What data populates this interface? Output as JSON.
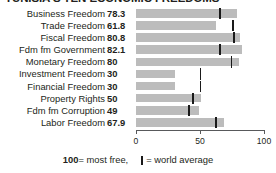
{
  "title": "TUNISIA'S TEN ECONOMIC FREEDOMS",
  "chart_data": {
    "type": "bar",
    "orientation": "horizontal",
    "title": "TUNISIA'S TEN ECONOMIC FREEDOMS",
    "xlabel": "",
    "ylabel": "",
    "xlim": [
      0,
      100
    ],
    "ticks": [
      "0",
      "50",
      "100"
    ],
    "grid": false,
    "legend_position": "bottom",
    "bar_color": "#bcbcbc",
    "marker_color": "#1a1a1a",
    "categories": [
      "Business Freedom",
      "Trade Freedom",
      "Fiscal Freedom",
      "Fdm fm Government",
      "Monetary Freedom",
      "Investment Freedom",
      "Financial Freedom",
      "Property Rights",
      "Fdm fm Corruption",
      "Labor Freedom"
    ],
    "values": [
      78.3,
      61.8,
      80.8,
      82.1,
      80,
      30,
      30,
      50,
      49,
      67.9
    ],
    "value_labels": [
      "78.3",
      "61.8",
      "80.8",
      "82.1",
      "80",
      "30",
      "30",
      "50",
      "49",
      "67.9"
    ],
    "world_average": [
      65,
      75,
      76,
      65,
      74,
      50,
      50,
      44,
      41,
      62
    ],
    "series": [
      {
        "name": "Tunisia score",
        "values": [
          78.3,
          61.8,
          80.8,
          82.1,
          80,
          30,
          30,
          50,
          49,
          67.9
        ]
      },
      {
        "name": "world average",
        "values": [
          65,
          75,
          76,
          65,
          74,
          50,
          50,
          44,
          41,
          62
        ]
      }
    ]
  },
  "rows": [
    {
      "label": "Business Freedom",
      "value": "78.3",
      "v": 78.3,
      "avg": 65
    },
    {
      "label": "Trade Freedom",
      "value": "61.8",
      "v": 61.8,
      "avg": 75
    },
    {
      "label": "Fiscal Freedom",
      "value": "80.8",
      "v": 80.8,
      "avg": 76
    },
    {
      "label": "Fdm fm Government",
      "value": "82.1",
      "v": 82.1,
      "avg": 65
    },
    {
      "label": "Monetary Freedom",
      "value": "80",
      "v": 80,
      "avg": 74
    },
    {
      "label": "Investment Freedom",
      "value": "30",
      "v": 30,
      "avg": 50
    },
    {
      "label": "Financial Freedom",
      "value": "30",
      "v": 30,
      "avg": 50
    },
    {
      "label": "Property Rights",
      "value": "50",
      "v": 50,
      "avg": 44
    },
    {
      "label": "Fdm fm Corruption",
      "value": "49",
      "v": 49,
      "avg": 41
    },
    {
      "label": "Labor Freedom",
      "value": "67.9",
      "v": 67.9,
      "avg": 62
    }
  ],
  "axis": {
    "min_label": "0",
    "mid_label": "50",
    "max_label": "100"
  },
  "legend": {
    "most_free_number": "100",
    "most_free_text": " = most free,",
    "average_text": "= world average"
  }
}
